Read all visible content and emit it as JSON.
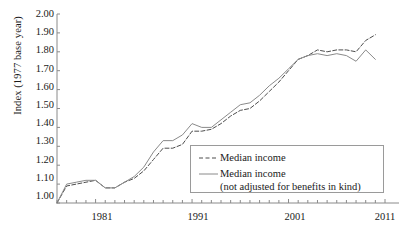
{
  "chart_data": {
    "type": "line",
    "title": "",
    "xlabel": "",
    "ylabel": "Index (1977 base year)",
    "xlim": [
      1977,
      2011
    ],
    "ylim": [
      1.0,
      2.0
    ],
    "ytick_labels": [
      "2.00",
      "1.90",
      "1.80",
      "1.70",
      "1.60",
      "1.50",
      "1.40",
      "1.30",
      "1.20",
      "1.10",
      "1.00"
    ],
    "ytick_values": [
      2.0,
      1.9,
      1.8,
      1.7,
      1.6,
      1.5,
      1.4,
      1.3,
      1.2,
      1.1,
      1.0
    ],
    "xtick_labels": [
      "1981",
      "1991",
      "2001",
      "2011"
    ],
    "xtick_values": [
      1981,
      1991,
      2001,
      2011
    ],
    "xtick_minor_step": 1,
    "grid": false,
    "legend_position": "inner-lower-right",
    "x": [
      1977,
      1978,
      1979,
      1980,
      1981,
      1982,
      1983,
      1984,
      1985,
      1986,
      1987,
      1988,
      1989,
      1990,
      1991,
      1992,
      1993,
      1994,
      1995,
      1996,
      1997,
      1998,
      1999,
      2000,
      2001,
      2002,
      2003,
      2004,
      2005,
      2006,
      2007,
      2008,
      2009,
      2010
    ],
    "series": [
      {
        "name": "Median income",
        "style": "dashed",
        "color": "#4d4d4d",
        "values": [
          1.0,
          1.09,
          1.1,
          1.11,
          1.12,
          1.08,
          1.08,
          1.11,
          1.13,
          1.17,
          1.23,
          1.29,
          1.29,
          1.31,
          1.38,
          1.38,
          1.39,
          1.42,
          1.46,
          1.49,
          1.5,
          1.54,
          1.59,
          1.64,
          1.7,
          1.76,
          1.78,
          1.81,
          1.8,
          1.81,
          1.81,
          1.8,
          1.86,
          1.89
        ]
      },
      {
        "name": "Median income (not adjusted for benefits in kind)",
        "style": "solid",
        "color": "#8a8a8a",
        "values": [
          1.0,
          1.1,
          1.11,
          1.12,
          1.12,
          1.08,
          1.08,
          1.11,
          1.14,
          1.19,
          1.27,
          1.33,
          1.33,
          1.36,
          1.42,
          1.4,
          1.4,
          1.44,
          1.48,
          1.52,
          1.53,
          1.57,
          1.62,
          1.66,
          1.71,
          1.76,
          1.78,
          1.79,
          1.78,
          1.79,
          1.78,
          1.75,
          1.81,
          1.76
        ]
      }
    ],
    "legend": [
      {
        "label": "Median income",
        "style": "dashed"
      },
      {
        "label": "Median income",
        "style": "solid",
        "sublabel": "(not adjusted for benefits in kind)"
      }
    ]
  },
  "axis": {
    "line_color": "#8a8a8a"
  }
}
